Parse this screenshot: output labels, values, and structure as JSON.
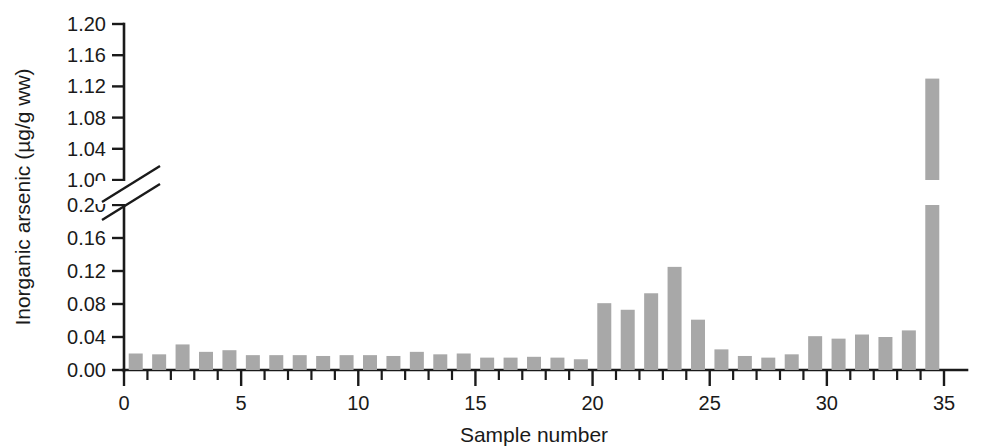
{
  "chart_data": {
    "type": "bar",
    "title": "",
    "xlabel": "Sample number",
    "ylabel": "Inorganic arsenic (µg/g ww)",
    "x": [
      1,
      2,
      3,
      4,
      5,
      6,
      7,
      8,
      9,
      10,
      11,
      12,
      13,
      14,
      15,
      16,
      17,
      18,
      19,
      20,
      21,
      22,
      23,
      24,
      25,
      26,
      27,
      28,
      29,
      30,
      31,
      32,
      33,
      34,
      35
    ],
    "values": [
      0.02,
      0.019,
      0.031,
      0.022,
      0.024,
      0.018,
      0.018,
      0.018,
      0.017,
      0.018,
      0.018,
      0.017,
      0.022,
      0.019,
      0.02,
      0.015,
      0.015,
      0.016,
      0.015,
      0.013,
      0.081,
      0.073,
      0.093,
      0.125,
      0.061,
      0.025,
      0.017,
      0.015,
      0.019,
      0.041,
      0.038,
      0.043,
      0.04,
      0.048,
      1.13
    ],
    "axis_broken": true,
    "break_between": [
      0.2,
      1.0
    ],
    "ylim_lower": [
      0.0,
      0.2
    ],
    "ylim_upper": [
      1.0,
      1.2
    ],
    "ytick_labels_lower": [
      "0.00",
      "0.04",
      "0.08",
      "0.12",
      "0.16",
      "0.20"
    ],
    "ytick_values_lower": [
      0.0,
      0.04,
      0.08,
      0.12,
      0.16,
      0.2
    ],
    "ytick_labels_upper": [
      "1.00",
      "1.04",
      "1.08",
      "1.12",
      "1.16",
      "1.20"
    ],
    "ytick_values_upper": [
      1.0,
      1.04,
      1.08,
      1.12,
      1.16,
      1.2
    ],
    "xtick_labels": [
      "0",
      "5",
      "10",
      "15",
      "20",
      "25",
      "30",
      "35"
    ],
    "xtick_values": [
      0,
      5,
      10,
      15,
      20,
      25,
      30,
      35
    ],
    "xlim": [
      0,
      35.8
    ],
    "grid": false,
    "legend": null,
    "bar_color": "#a8a8a8",
    "axis_color": "#1a1a1a"
  }
}
